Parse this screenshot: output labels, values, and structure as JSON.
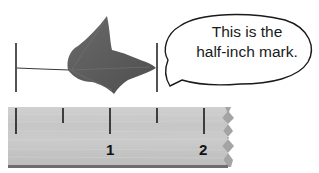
{
  "speech_bubble": {
    "line1": "This is the",
    "line2": "half-inch mark."
  },
  "ruler": {
    "labels": [
      "1",
      "2"
    ],
    "color": "#c8c8c8",
    "edge_color": "#6e6e6e"
  },
  "object": {
    "name": "leaf",
    "color": "#5e5e5e"
  },
  "measure_bars": {
    "left_label": "",
    "right_label": ""
  }
}
